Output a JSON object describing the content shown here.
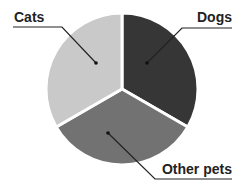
{
  "chart_data": {
    "type": "pie",
    "title": "",
    "categories": [
      "Dogs",
      "Other pets",
      "Cats"
    ],
    "values": [
      33.3,
      33.3,
      33.3
    ],
    "colors": [
      "#363636",
      "#727272",
      "#c9c9c9"
    ],
    "start_angle_deg": 90,
    "direction": "clockwise",
    "labels_shown": true,
    "values_shown": false,
    "legend": "none (leader-line callouts)",
    "slices": [
      {
        "label": "Dogs",
        "value": 33.3,
        "color": "#363636"
      },
      {
        "label": "Other pets",
        "value": 33.3,
        "color": "#727272"
      },
      {
        "label": "Cats",
        "value": 33.3,
        "color": "#c9c9c9"
      }
    ]
  },
  "labels": {
    "cats": "Cats",
    "dogs": "Dogs",
    "other": "Other pets"
  }
}
